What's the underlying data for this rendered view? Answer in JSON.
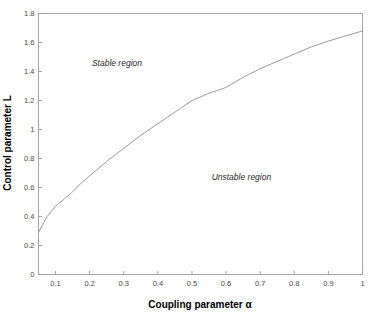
{
  "chart_data": {
    "type": "line",
    "title": "",
    "xlabel": "Coupling parameter α",
    "ylabel": "Control parameter L",
    "xlim": [
      0.05,
      1.0
    ],
    "ylim": [
      0,
      1.8
    ],
    "grid": false,
    "legend": "none",
    "xticks": [
      0.1,
      0.2,
      0.3,
      0.4,
      0.5,
      0.6,
      0.7,
      0.8,
      0.9,
      1
    ],
    "xticklabels": [
      "0.1",
      "0.2",
      "0.3",
      "0.4",
      "0.5",
      "0.6",
      "0.7",
      "0.8",
      "0.9",
      "1"
    ],
    "yticks": [
      0,
      0.2,
      0.4,
      0.6,
      0.8,
      1,
      1.2,
      1.4,
      1.6,
      1.8
    ],
    "yticklabels": [
      "0",
      "0.2",
      "0.4",
      "0.6",
      "0.8",
      "1",
      "1.2",
      "1.4",
      "1.6",
      "1.8"
    ],
    "series": [
      {
        "name": "stability boundary",
        "color": "#8e8e8e",
        "x": [
          0.05,
          0.075,
          0.1,
          0.125,
          0.15,
          0.175,
          0.2,
          0.25,
          0.3,
          0.35,
          0.4,
          0.45,
          0.5,
          0.55,
          0.6,
          0.65,
          0.7,
          0.75,
          0.8,
          0.85,
          0.9,
          0.95,
          1.0
        ],
        "y": [
          0.29,
          0.4,
          0.47,
          0.52,
          0.57,
          0.63,
          0.68,
          0.78,
          0.87,
          0.96,
          1.04,
          1.12,
          1.2,
          1.25,
          1.29,
          1.36,
          1.42,
          1.47,
          1.52,
          1.57,
          1.61,
          1.645,
          1.68
        ]
      }
    ],
    "annotations": [
      {
        "text": "Stable region",
        "x": 0.28,
        "y": 1.44,
        "style": "italic"
      },
      {
        "text": "Unstable region",
        "x": 0.645,
        "y": 0.655,
        "style": "italic"
      }
    ]
  }
}
